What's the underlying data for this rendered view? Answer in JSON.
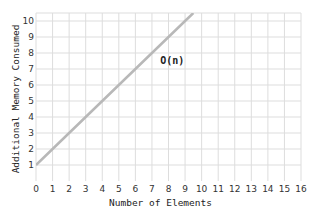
{
  "chart_data": {
    "type": "line",
    "title": "",
    "xlabel": "Number of Elements",
    "ylabel": "Additional Memory Consumed",
    "xlim": [
      0,
      16
    ],
    "ylim": [
      0,
      10.5
    ],
    "x_ticks": [
      0,
      1,
      2,
      3,
      4,
      5,
      6,
      7,
      8,
      9,
      10,
      11,
      12,
      13,
      14,
      15,
      16
    ],
    "y_ticks": [
      1,
      2,
      3,
      4,
      5,
      6,
      7,
      8,
      9,
      10
    ],
    "y_zero_label": "0",
    "grid": true,
    "legend": null,
    "series": [
      {
        "name": "O(n)",
        "color": "#b8b8b8",
        "x": [
          0,
          1,
          2,
          3,
          4,
          5,
          6,
          7,
          8,
          9,
          9.5
        ],
        "y": [
          1,
          2,
          3,
          4,
          5,
          6,
          7,
          8,
          9,
          10,
          10.5
        ]
      }
    ],
    "annotations": [
      {
        "text": "O(n)",
        "x": 7.5,
        "y": 7.3
      }
    ]
  },
  "colors": {
    "grid": "#dddddd",
    "line": "#b8b8b8",
    "text": "#333333"
  }
}
